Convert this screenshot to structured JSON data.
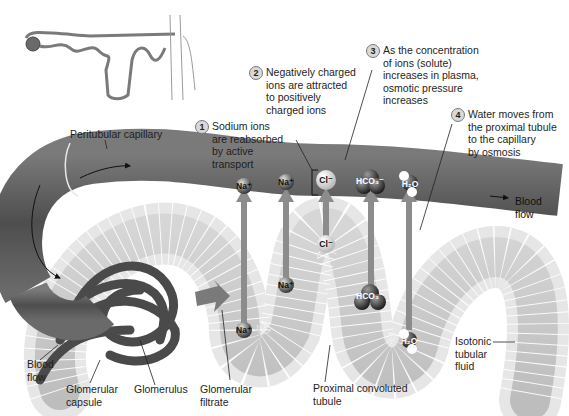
{
  "figure": {
    "colors": {
      "capillary": "#5a5a5a",
      "capillary_highlight": "#8a8a8a",
      "tubule_wall": "#e4e4e4",
      "tubule_lumen": "#c9c9c9",
      "arrow": "#8c8c8c",
      "text": "#1e1e1e"
    }
  },
  "steps": [
    {
      "number": "1",
      "text": "Sodium ions\nare reabsorbed\nby active\ntransport"
    },
    {
      "number": "2",
      "text": "Negatively charged\nions are attracted\nto positively\ncharged ions"
    },
    {
      "number": "3",
      "text": "As the concentration\nof ions (solute)\nincreases in plasma,\nosmotic pressure\nincreases"
    },
    {
      "number": "4",
      "text": "Water moves from\nthe proximal tubule\nto the capillary\nby osmosis"
    }
  ],
  "labels": {
    "peritubular_capillary": "Peritubular capillary",
    "blood_flow_right": "Blood\nflow",
    "blood_flow_left": "Blood\nflow",
    "glomerular_capsule": "Glomerular\ncapsule",
    "glomerulus": "Glomerulus",
    "glomerular_filtrate": "Glomerular\nfiltrate",
    "proximal_convoluted_tubule": "Proximal convoluted\ntubule",
    "isotonic_tubular_fluid": "Isotonic\ntubular\nfluid"
  },
  "ions": {
    "capillary": [
      {
        "symbol": "Na⁺",
        "icon": "sodium-ion"
      },
      {
        "symbol": "Na⁺",
        "icon": "sodium-ion"
      },
      {
        "symbol": "Cl⁻",
        "icon": "chloride-ion"
      },
      {
        "symbol": "HCO₃⁻",
        "icon": "bicarbonate-ion"
      },
      {
        "symbol": "H₂O",
        "icon": "water-molecule"
      }
    ],
    "tubule": [
      {
        "symbol": "Na⁺",
        "icon": "sodium-ion"
      },
      {
        "symbol": "Na⁺",
        "icon": "sodium-ion"
      },
      {
        "symbol": "Cl⁻",
        "icon": "chloride-ion"
      },
      {
        "symbol": "HCO₃⁻",
        "icon": "bicarbonate-ion"
      },
      {
        "symbol": "H₂O",
        "icon": "water-molecule"
      }
    ]
  }
}
